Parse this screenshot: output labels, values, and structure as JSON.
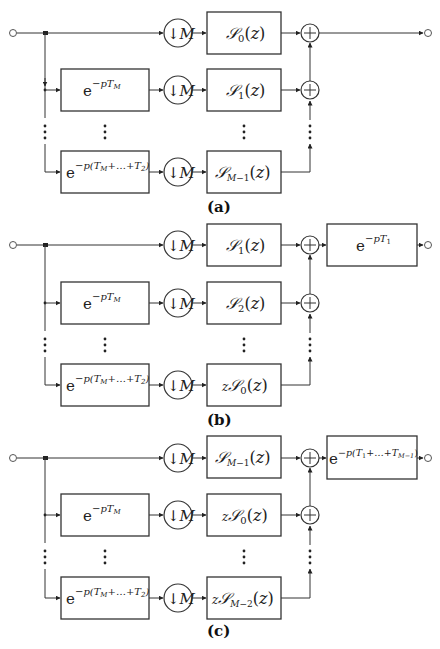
{
  "figure": {
    "type": "block-diagram",
    "panels": [
      {
        "id": "a",
        "caption": "(a)",
        "input_label": "",
        "rows": [
          {
            "delay": "",
            "delay_sup": "",
            "downsampler": "↓M",
            "filter": "𝒮",
            "filter_sub": "0",
            "filter_arg": "(z)",
            "filter_prefix": ""
          },
          {
            "delay": "e",
            "delay_sup": "−pT_M",
            "downsampler": "↓M",
            "filter": "𝒮",
            "filter_sub": "1",
            "filter_arg": "(z)",
            "filter_prefix": ""
          },
          {
            "delay": "e",
            "delay_sup": "−p(T_M+…+T_2)",
            "downsampler": "↓M",
            "filter": "𝒮",
            "filter_sub": "M−1",
            "filter_arg": "(z)",
            "filter_prefix": ""
          }
        ],
        "output_delay": "",
        "output_delay_sup": ""
      },
      {
        "id": "b",
        "caption": "(b)",
        "rows": [
          {
            "delay": "",
            "delay_sup": "",
            "downsampler": "↓M",
            "filter": "𝒮",
            "filter_sub": "1",
            "filter_arg": "(z)",
            "filter_prefix": ""
          },
          {
            "delay": "e",
            "delay_sup": "−pT_M",
            "downsampler": "↓M",
            "filter": "𝒮",
            "filter_sub": "2",
            "filter_arg": "(z)",
            "filter_prefix": ""
          },
          {
            "delay": "e",
            "delay_sup": "−p(T_M+…+T_2)",
            "downsampler": "↓M",
            "filter": "𝒮",
            "filter_sub": "0",
            "filter_arg": "(z)",
            "filter_prefix": "z"
          }
        ],
        "output_delay": "e",
        "output_delay_sup": "−pT_1"
      },
      {
        "id": "c",
        "caption": "(c)",
        "rows": [
          {
            "delay": "",
            "delay_sup": "",
            "downsampler": "↓M",
            "filter": "𝒮",
            "filter_sub": "M−1",
            "filter_arg": "(z)",
            "filter_prefix": ""
          },
          {
            "delay": "e",
            "delay_sup": "−pT_M",
            "downsampler": "↓M",
            "filter": "𝒮",
            "filter_sub": "0",
            "filter_arg": "(z)",
            "filter_prefix": "z"
          },
          {
            "delay": "e",
            "delay_sup": "−p(T_M+…+T_2)",
            "downsampler": "↓M",
            "filter": "𝒮",
            "filter_sub": "M−2",
            "filter_arg": "(z)",
            "filter_prefix": "z"
          }
        ],
        "output_delay": "e",
        "output_delay_sup": "−p(T_1+…+T_{M−1})"
      }
    ],
    "symbols": {
      "sum": "+",
      "vdots": "⋮"
    }
  }
}
